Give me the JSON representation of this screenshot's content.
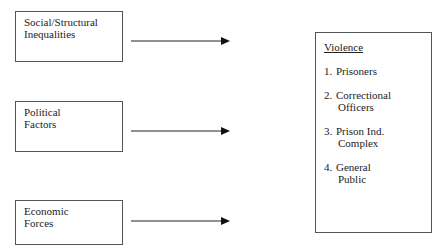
{
  "causes": [
    {
      "lines": [
        "Social/Structural",
        "Inequalities"
      ]
    },
    {
      "lines": [
        "Political",
        "Factors"
      ]
    },
    {
      "lines": [
        "Economic",
        "Forces"
      ]
    }
  ],
  "effect": {
    "title": "Violence",
    "items": [
      {
        "num": "1.",
        "lines": [
          "Prisoners"
        ]
      },
      {
        "num": "2.",
        "lines": [
          "Correctional",
          "Officers"
        ]
      },
      {
        "num": "3.",
        "lines": [
          "Prison Ind.",
          "Complex"
        ]
      },
      {
        "num": "4.",
        "lines": [
          "General",
          "Public"
        ]
      }
    ]
  },
  "colors": {
    "line": "#222222",
    "border": "#555555"
  }
}
